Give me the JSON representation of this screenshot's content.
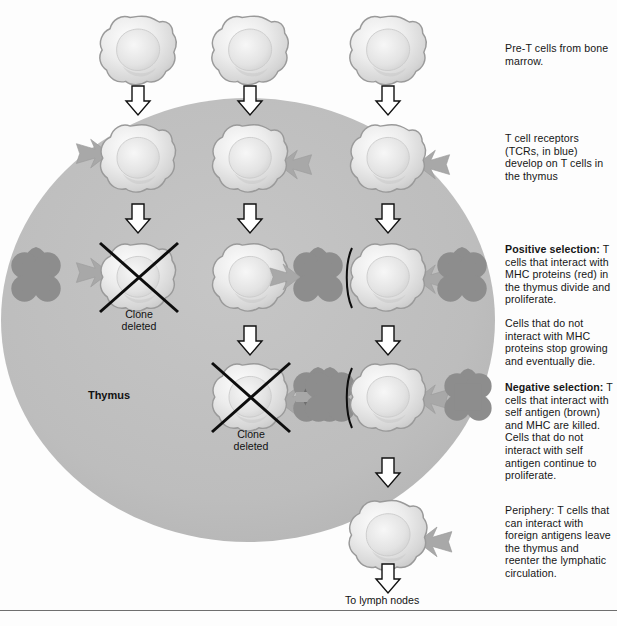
{
  "figure": {
    "organ_label": "Thymus",
    "bottom_caption": "To lymph nodes",
    "clone_deleted_label": "Clone\ndeleted"
  },
  "colors": {
    "thymus_fill": "#bdbdbd",
    "cell_body": "#e6e6e6",
    "cell_outline": "#9a9a9a",
    "tcr": "#a8a8a8",
    "mhc": "#8d8d8d",
    "self_antigen": "#6e6e6e",
    "arrow_outline": "#111111",
    "arrow_fill": "#ffffff",
    "x_mark": "#0d0d0d",
    "text": "#161616",
    "rule": "#6f6f6f"
  },
  "notes": [
    {
      "id": "note-pre-t",
      "heading": "",
      "body": "Pre-T cells from bone marrow.",
      "extra": ""
    },
    {
      "id": "note-tcr",
      "heading": "",
      "body": "T cell receptors (TCRs, in blue) develop on T cells in the thymus",
      "extra": ""
    },
    {
      "id": "note-positive",
      "heading": "Positive selection:",
      "body": "T cells that interact with MHC proteins (red) in the thymus divide and proliferate.",
      "extra": "Cells that do not interact with MHC proteins stop growing and eventually die."
    },
    {
      "id": "note-negative",
      "heading": "Negative selection:",
      "body": "T cells that interact with self antigen (brown) and MHC are killed. Cells that do not interact with self antigen continue to proliferate.",
      "extra": ""
    },
    {
      "id": "note-periphery",
      "heading": "",
      "body": "Periphery: T cells that can interact with foreign antigens leave the thymus and reenter the lymphatic circulation.",
      "extra": ""
    }
  ],
  "rows": [
    {
      "name": "row-pre-t-cells",
      "stage": "Pre-T cells from bone marrow",
      "y": 50,
      "cells": [
        {
          "column": "left",
          "x": 138,
          "tcr": false,
          "deleted": false,
          "mhc": null
        },
        {
          "column": "middle",
          "x": 250,
          "tcr": false,
          "deleted": false,
          "mhc": null
        },
        {
          "column": "right",
          "x": 388,
          "tcr": false,
          "deleted": false,
          "mhc": null
        }
      ]
    },
    {
      "name": "row-tcr-development",
      "stage": "TCRs develop on T cells in the thymus",
      "y": 158,
      "cells": [
        {
          "column": "left",
          "x": 138,
          "tcr": true,
          "tcr_side": "left",
          "deleted": false,
          "mhc": null
        },
        {
          "column": "middle",
          "x": 250,
          "tcr": true,
          "tcr_side": "right",
          "deleted": false,
          "mhc": null
        },
        {
          "column": "right",
          "x": 388,
          "tcr": true,
          "tcr_side": "right",
          "deleted": false,
          "mhc": null
        }
      ]
    },
    {
      "name": "row-positive-selection",
      "stage": "Positive selection",
      "y": 277,
      "cells": [
        {
          "column": "left",
          "x": 138,
          "tcr": true,
          "tcr_side": "left",
          "deleted": true,
          "mhc": null
        },
        {
          "column": "middle",
          "x": 250,
          "tcr": false,
          "deleted": false,
          "mhc": null
        },
        {
          "column": "right",
          "x": 388,
          "tcr": true,
          "tcr_side": "both",
          "deleted": false,
          "mhc": "mhc-only"
        }
      ]
    },
    {
      "name": "row-negative-selection",
      "stage": "Negative selection",
      "y": 397,
      "cells": [
        {
          "column": "middle",
          "x": 250,
          "tcr": true,
          "tcr_side": "right",
          "deleted": true,
          "mhc": "mhc-with-self-antigen"
        },
        {
          "column": "right",
          "x": 388,
          "tcr": true,
          "tcr_side": "both",
          "deleted": false,
          "mhc": "mhc-only"
        }
      ]
    },
    {
      "name": "row-periphery",
      "stage": "Periphery",
      "y": 535,
      "cells": [
        {
          "column": "right",
          "x": 388,
          "tcr": true,
          "tcr_side": "right",
          "deleted": false,
          "mhc": null
        }
      ]
    }
  ],
  "arrows": [
    {
      "name": "arrow-left-1",
      "x": 138,
      "y": 100
    },
    {
      "name": "arrow-middle-1",
      "x": 250,
      "y": 100
    },
    {
      "name": "arrow-right-1",
      "x": 388,
      "y": 100
    },
    {
      "name": "arrow-left-2",
      "x": 138,
      "y": 218
    },
    {
      "name": "arrow-middle-2",
      "x": 250,
      "y": 218
    },
    {
      "name": "arrow-right-2",
      "x": 388,
      "y": 218
    },
    {
      "name": "arrow-middle-3",
      "x": 250,
      "y": 340
    },
    {
      "name": "arrow-right-3",
      "x": 388,
      "y": 340
    },
    {
      "name": "arrow-right-4",
      "x": 388,
      "y": 472
    },
    {
      "name": "arrow-right-5",
      "x": 388,
      "y": 576
    }
  ],
  "deleted_markers": [
    {
      "name": "clone-deleted-left",
      "cx": 138,
      "cy": 277,
      "label_y": 308
    },
    {
      "name": "clone-deleted-middle",
      "cx": 250,
      "cy": 397,
      "label_y": 428
    }
  ],
  "thymus": {
    "cx": 248,
    "cy": 320,
    "rx": 247,
    "ry": 222,
    "label_x": 108,
    "label_y": 396
  }
}
